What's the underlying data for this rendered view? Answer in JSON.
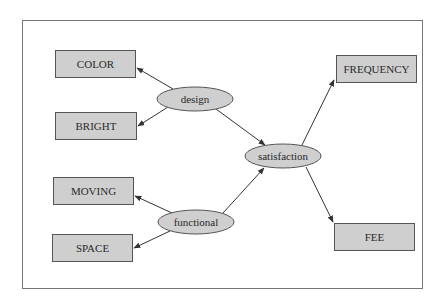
{
  "diagram": {
    "type": "directed-graph",
    "colors": {
      "node_fill": "#cfcfcf",
      "node_stroke": "#555555",
      "edge": "#333333",
      "frame": "#777777",
      "text": "#2a2a2a"
    },
    "nodes": {
      "color": {
        "label": "COLOR",
        "shape": "box"
      },
      "bright": {
        "label": "BRIGHT",
        "shape": "box"
      },
      "design": {
        "label": "design",
        "shape": "ellipse"
      },
      "satisfaction": {
        "label": "satisfaction",
        "shape": "ellipse"
      },
      "functional": {
        "label": "functional",
        "shape": "ellipse"
      },
      "moving": {
        "label": "MOVING",
        "shape": "box"
      },
      "space": {
        "label": "SPACE",
        "shape": "box"
      },
      "frequency": {
        "label": "FREQUENCY",
        "shape": "box"
      },
      "fee": {
        "label": "FEE",
        "shape": "box"
      }
    },
    "edges": [
      {
        "from": "design",
        "to": "COLOR"
      },
      {
        "from": "design",
        "to": "BRIGHT"
      },
      {
        "from": "design",
        "to": "satisfaction"
      },
      {
        "from": "functional",
        "to": "MOVING"
      },
      {
        "from": "functional",
        "to": "SPACE"
      },
      {
        "from": "functional",
        "to": "satisfaction"
      },
      {
        "from": "satisfaction",
        "to": "FREQUENCY"
      },
      {
        "from": "satisfaction",
        "to": "FEE"
      }
    ]
  }
}
